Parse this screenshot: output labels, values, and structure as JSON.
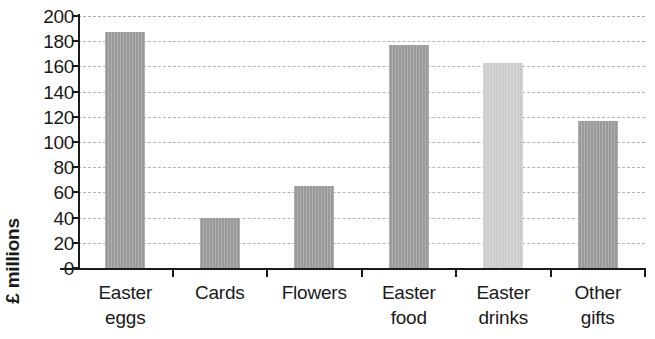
{
  "chart_data": {
    "type": "bar",
    "title": "",
    "xlabel": "",
    "ylabel": "£ millions",
    "categories": [
      "Easter eggs",
      "Cards",
      "Flowers",
      "Easter food",
      "Easter drinks",
      "Other gifts"
    ],
    "category_lines": [
      [
        "Easter",
        "eggs"
      ],
      [
        "Cards",
        ""
      ],
      [
        "Flowers",
        ""
      ],
      [
        "Easter",
        "food"
      ],
      [
        "Easter",
        "drinks"
      ],
      [
        "Other",
        "gifts"
      ]
    ],
    "values": [
      187,
      40,
      65,
      177,
      163,
      117
    ],
    "bar_colors": [
      "#9a9a9a",
      "#9a9a9a",
      "#9a9a9a",
      "#9a9a9a",
      "#cccccc",
      "#9a9a9a"
    ],
    "ylim": [
      0,
      200
    ],
    "ytick_step": 20,
    "yticks": [
      200,
      180,
      160,
      140,
      120,
      100,
      80,
      60,
      40,
      20,
      0
    ],
    "ytick_labels": [
      "200",
      "180",
      "160",
      "140",
      "120",
      "100",
      "80",
      "60",
      "40",
      "20",
      "0"
    ],
    "grid": true,
    "grid_axis": "y",
    "grid_style": "dashed",
    "grid_color": "#a8a8a8",
    "legend": false,
    "legend_position": "none",
    "axis_color": "#1a1a1a",
    "background_color": "#ffffff"
  }
}
